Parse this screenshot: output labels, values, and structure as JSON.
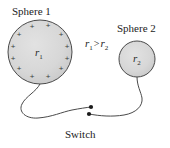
{
  "figure": {
    "type": "physics-diagram",
    "title_labels": {
      "sphere1": "Sphere 1",
      "sphere2": "Sphere 2",
      "switch": "Switch"
    },
    "relation": {
      "left": "r",
      "left_sub": "1",
      "operator": ">",
      "right": "r",
      "right_sub": "2",
      "text": "r1 > r2"
    },
    "sphere1": {
      "label": "Sphere 1",
      "radius_symbol": "r",
      "radius_subscript": "1",
      "cx": 40,
      "cy": 52,
      "r": 32,
      "fill": "#d6d6d6",
      "stroke": "#4a4a4a",
      "charge_symbol": "+",
      "charge_count": 12,
      "charges": [
        {
          "x": 32,
          "y": 27
        },
        {
          "x": 48,
          "y": 26
        },
        {
          "x": 19,
          "y": 35
        },
        {
          "x": 61,
          "y": 35
        },
        {
          "x": 13,
          "y": 47
        },
        {
          "x": 67,
          "y": 47
        },
        {
          "x": 13,
          "y": 59
        },
        {
          "x": 67,
          "y": 59
        },
        {
          "x": 19,
          "y": 69
        },
        {
          "x": 61,
          "y": 69
        },
        {
          "x": 32,
          "y": 77
        },
        {
          "x": 48,
          "y": 77
        }
      ]
    },
    "sphere2": {
      "label": "Sphere 2",
      "radius_symbol": "r",
      "radius_subscript": "2",
      "cx": 137,
      "cy": 59,
      "r": 18,
      "fill": "#d6d6d6",
      "stroke": "#4a4a4a",
      "charge_symbol": "",
      "charge_count": 0
    },
    "switch": {
      "label": "Switch",
      "state": "open",
      "contact_upper": {
        "x": 91,
        "y": 107
      },
      "contact_lower": {
        "x": 89,
        "y": 114
      },
      "dot_color": "#1a1a1a",
      "dot_radius": 2.1
    },
    "wires": {
      "color": "#4a4a4a",
      "width": 1,
      "left_path": "M 40 84 C 36 92, 26 96, 22 104 C 18 112, 26 119, 38 118 C 52 117, 62 112, 72 110 C 80 108.5, 86 107.6, 91 107",
      "right_path": "M 137 77 C 137 86, 141 92, 142 98 C 143 106, 136 113, 124 115 C 112 117, 100 116, 89 114"
    },
    "colors": {
      "background": "#ffffff",
      "ink": "#232323",
      "sphere_fill": "#d6d6d6",
      "sphere_stroke": "#4a4a4a",
      "wire": "#4a4a4a"
    }
  }
}
